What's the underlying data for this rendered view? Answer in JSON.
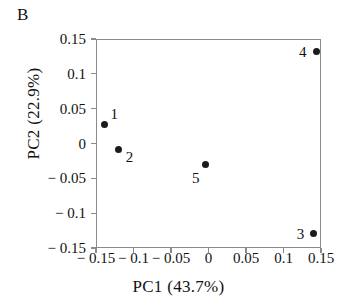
{
  "figure": {
    "panel_label": "B",
    "background_color": "#ffffff",
    "axis_color": "#8a8a8a",
    "marker_color": "#1b1b1b",
    "text_color": "#111111"
  },
  "chart_data": {
    "type": "scatter",
    "title": "",
    "xlabel": "PC1 (43.7%)",
    "ylabel": "PC2 (22.9%)",
    "xlim": [
      -0.15,
      0.15
    ],
    "ylim": [
      -0.15,
      0.15
    ],
    "xticks": [
      -0.15,
      -0.1,
      -0.05,
      0,
      0.05,
      0.1,
      0.15
    ],
    "yticks": [
      0.15,
      0.1,
      0.05,
      0,
      -0.05,
      -0.1,
      -0.15
    ],
    "xtick_labels": [
      "− 0.15",
      "− 0.1",
      "− 0.05",
      "0",
      "0.05",
      "0.1",
      "0.15"
    ],
    "ytick_labels": [
      "0.15",
      "0.1",
      "0.05",
      "0",
      "− 0.05",
      "− 0.1",
      "− 0.15"
    ],
    "grid": false,
    "legend": false,
    "points": [
      {
        "label": "1",
        "x": -0.14,
        "y": 0.029,
        "label_dx": 6,
        "label_dy": -17
      },
      {
        "label": "2",
        "x": -0.121,
        "y": -0.007,
        "label_dx": 7,
        "label_dy": 1
      },
      {
        "label": "3",
        "x": 0.139,
        "y": -0.128,
        "label_dx": -17,
        "label_dy": -7
      },
      {
        "label": "4",
        "x": 0.142,
        "y": 0.134,
        "label_dx": -17,
        "label_dy": -6
      },
      {
        "label": "5",
        "x": -0.006,
        "y": -0.028,
        "label_dx": -13,
        "label_dy": 7
      }
    ]
  }
}
